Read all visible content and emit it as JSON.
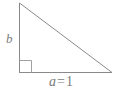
{
  "figure": {
    "type": "right-triangle-diagram",
    "background_color": "#ffffff",
    "stroke_color": "#8a8a8a",
    "text_color": "#7d7d7d"
  },
  "geometry": {
    "vertices": {
      "apex": {
        "x": 19,
        "y": 3
      },
      "right_angle": {
        "x": 19,
        "y": 72
      },
      "base_right": {
        "x": 112,
        "y": 72
      }
    },
    "right_angle_marker": {
      "x": 19,
      "y": 60,
      "size": 12
    }
  },
  "labels": {
    "vertical_leg": {
      "text": "b",
      "style": "italic"
    },
    "base_leg": {
      "variable": "a",
      "operator": "=",
      "value": "1",
      "full_text": "a = 1"
    }
  }
}
